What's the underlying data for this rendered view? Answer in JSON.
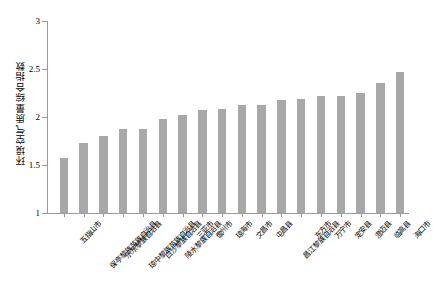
{
  "chart_data": {
    "type": "bar",
    "title": "",
    "xlabel": "",
    "ylabel": "环境空气质量综合指数",
    "ylim": [
      1,
      3
    ],
    "ytick_labels": [
      "1",
      "1.5",
      "2",
      "2.5",
      "3"
    ],
    "ytick_values": [
      1,
      1.5,
      2,
      2.5,
      3
    ],
    "grid": false,
    "legend": null,
    "bar_color": "#a8a8a8",
    "categories": [
      "五指山市",
      "保亭黎族苗族自治县",
      "乐东黎族自治县",
      "琼中黎族苗族自治县",
      "白沙黎族自治县",
      "陵水黎族自治县",
      "三亚市",
      "儋州市",
      "琼海市",
      "文昌市",
      "屯昌县",
      "昌江黎族自治县",
      "东方市",
      "万宁市",
      "定安县",
      "澄迈县",
      "临高县",
      "海口市"
    ],
    "values": [
      1.57,
      1.73,
      1.8,
      1.87,
      1.88,
      1.98,
      2.02,
      2.07,
      2.08,
      2.12,
      2.12,
      2.18,
      2.19,
      2.22,
      2.22,
      2.25,
      2.35,
      2.47
    ]
  },
  "caption": ""
}
